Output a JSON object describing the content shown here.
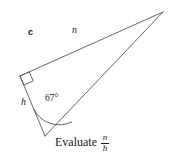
{
  "figure": {
    "background_color": "#ffffff",
    "stroke_color": "#555555",
    "text_color": "#1a1a1a",
    "width": 171,
    "height": 156
  },
  "diagram": {
    "type": "right-triangle",
    "part_label": "c",
    "vertices": {
      "right_angle_vertex": [
        20,
        76
      ],
      "apex_vertex": [
        163,
        12
      ],
      "angle_vertex": [
        45,
        136
      ]
    },
    "labels": {
      "side_n": "n",
      "side_h": "h",
      "angle": "67°"
    },
    "right_angle_marker": true,
    "angle_arc": true
  },
  "caption": {
    "text": "Evaluate",
    "fraction_numerator": "n",
    "fraction_denominator": "h"
  }
}
